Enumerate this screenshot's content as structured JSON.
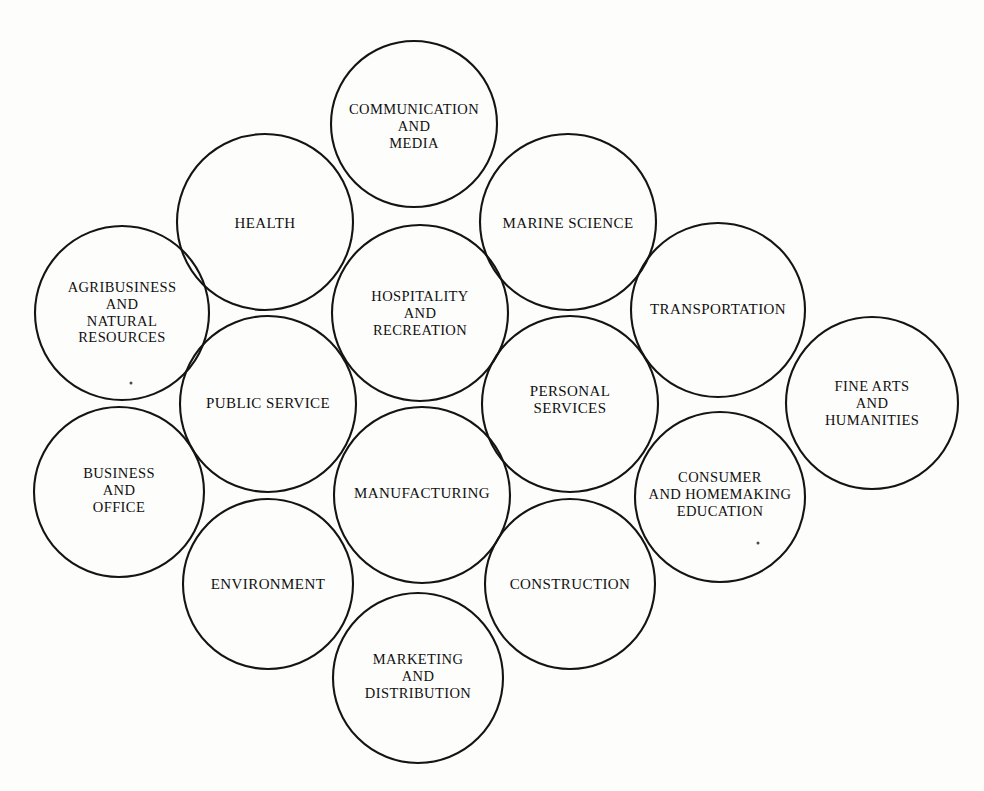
{
  "diagram": {
    "type": "overlapping-circles-cluster-map",
    "title": "",
    "background_color": "#fdfdfc",
    "stroke_color": "#141414",
    "text_color": "#101010",
    "canvas": {
      "width": 984,
      "height": 791
    },
    "clusters": [
      {
        "id": "communication-and-media",
        "label": "COMMUNICATION\nAND\nMEDIA",
        "cx": 414,
        "cy": 124,
        "r": 83,
        "font_size": 14.5,
        "label_cx": 414,
        "label_cy": 126
      },
      {
        "id": "health",
        "label": "HEALTH",
        "cx": 265,
        "cy": 222,
        "r": 88,
        "font_size": 15,
        "label_cx": 265,
        "label_cy": 224
      },
      {
        "id": "marine-science",
        "label": "MARINE SCIENCE",
        "cx": 568,
        "cy": 222,
        "r": 88,
        "font_size": 15,
        "label_cx": 568,
        "label_cy": 224
      },
      {
        "id": "agribusiness-and-natural-resources",
        "label": "AGRIBUSINESS\nAND\nNATURAL\nRESOURCES",
        "cx": 122,
        "cy": 313,
        "r": 87,
        "font_size": 14.5,
        "label_cx": 122,
        "label_cy": 313
      },
      {
        "id": "hospitality-and-recreation",
        "label": "HOSPITALITY\nAND\nRECREATION",
        "cx": 420,
        "cy": 313,
        "r": 88,
        "font_size": 14.5,
        "label_cx": 420,
        "label_cy": 313
      },
      {
        "id": "transportation",
        "label": "TRANSPORTATION",
        "cx": 718,
        "cy": 310,
        "r": 87,
        "font_size": 15,
        "label_cx": 718,
        "label_cy": 310
      },
      {
        "id": "fine-arts-and-humanities",
        "label": "FINE ARTS\nAND\nHUMANITIES",
        "cx": 872,
        "cy": 403,
        "r": 86,
        "font_size": 14.5,
        "label_cx": 872,
        "label_cy": 403
      },
      {
        "id": "public-service",
        "label": "PUBLIC SERVICE",
        "cx": 268,
        "cy": 404,
        "r": 88,
        "font_size": 15,
        "label_cx": 268,
        "label_cy": 404
      },
      {
        "id": "personal-services",
        "label": "PERSONAL\nSERVICES",
        "cx": 570,
        "cy": 404,
        "r": 88,
        "font_size": 15,
        "label_cx": 570,
        "label_cy": 400
      },
      {
        "id": "business-and-office",
        "label": "BUSINESS\nAND\nOFFICE",
        "cx": 119,
        "cy": 492,
        "r": 85,
        "font_size": 14.5,
        "label_cx": 119,
        "label_cy": 490
      },
      {
        "id": "manufacturing",
        "label": "MANUFACTURING",
        "cx": 422,
        "cy": 495,
        "r": 88,
        "font_size": 15,
        "label_cx": 422,
        "label_cy": 494
      },
      {
        "id": "consumer-and-homemaking-education",
        "label": "CONSUMER\nAND HOMEMAKING\nEDUCATION",
        "cx": 720,
        "cy": 497,
        "r": 85,
        "font_size": 14.5,
        "label_cx": 720,
        "label_cy": 494
      },
      {
        "id": "environment",
        "label": "ENVIRONMENT",
        "cx": 268,
        "cy": 584,
        "r": 85,
        "font_size": 15,
        "label_cx": 268,
        "label_cy": 585
      },
      {
        "id": "construction",
        "label": "CONSTRUCTION",
        "cx": 570,
        "cy": 584,
        "r": 85,
        "font_size": 15,
        "label_cx": 570,
        "label_cy": 585
      },
      {
        "id": "marketing-and-distribution",
        "label": "MARKETING\nAND\nDISTRIBUTION",
        "cx": 418,
        "cy": 678,
        "r": 85,
        "font_size": 14.5,
        "label_cx": 418,
        "label_cy": 676
      }
    ],
    "specks": [
      {
        "x": 131,
        "y": 383
      },
      {
        "x": 758,
        "y": 543
      }
    ]
  }
}
